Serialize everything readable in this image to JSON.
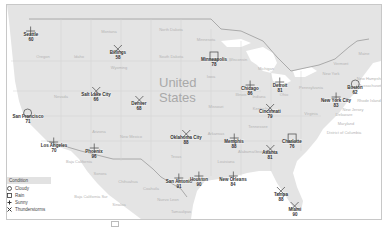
{
  "map": {
    "country_label_line1": "United",
    "country_label_line2": "States",
    "regions": [
      {
        "name": "Montana",
        "x": 108,
        "y": 30
      },
      {
        "name": "North Dakota",
        "x": 170,
        "y": 28
      },
      {
        "name": "Minnesota",
        "x": 205,
        "y": 38
      },
      {
        "name": "South Dakota",
        "x": 170,
        "y": 55
      },
      {
        "name": "Wyoming",
        "x": 118,
        "y": 66
      },
      {
        "name": "Oregon",
        "x": 42,
        "y": 55
      },
      {
        "name": "Idaho",
        "x": 78,
        "y": 55
      },
      {
        "name": "Nevada",
        "x": 60,
        "y": 95
      },
      {
        "name": "Iowa",
        "x": 210,
        "y": 75
      },
      {
        "name": "Missouri",
        "x": 215,
        "y": 105
      },
      {
        "name": "Arizona",
        "x": 98,
        "y": 130
      },
      {
        "name": "New Mexico",
        "x": 130,
        "y": 135
      },
      {
        "name": "Texas",
        "x": 175,
        "y": 155
      },
      {
        "name": "Arkansas",
        "x": 215,
        "y": 132
      },
      {
        "name": "Tennessee",
        "x": 257,
        "y": 125
      },
      {
        "name": "Kentucky",
        "x": 260,
        "y": 107
      },
      {
        "name": "Virginia",
        "x": 310,
        "y": 112
      },
      {
        "name": "Pennsylvania",
        "x": 310,
        "y": 86
      },
      {
        "name": "Michigan",
        "x": 265,
        "y": 67
      },
      {
        "name": "Wisconsin",
        "x": 237,
        "y": 58
      },
      {
        "name": "Ohio",
        "x": 283,
        "y": 93
      },
      {
        "name": "Illinois",
        "x": 240,
        "y": 93
      },
      {
        "name": "Indiana",
        "x": 258,
        "y": 95
      },
      {
        "name": "Georgia",
        "x": 260,
        "y": 150
      },
      {
        "name": "Louisiana",
        "x": 225,
        "y": 160
      },
      {
        "name": "Alabama",
        "x": 245,
        "y": 150
      },
      {
        "name": "Chihuahua",
        "x": 127,
        "y": 180
      },
      {
        "name": "Sonora",
        "x": 99,
        "y": 172
      },
      {
        "name": "Coahuila",
        "x": 150,
        "y": 187
      },
      {
        "name": "Baja California",
        "x": 78,
        "y": 160
      },
      {
        "name": "Baja California Sur",
        "x": 90,
        "y": 195
      },
      {
        "name": "Nuevo Leon",
        "x": 167,
        "y": 198
      },
      {
        "name": "Tamaulipas",
        "x": 180,
        "y": 210
      },
      {
        "name": "Sinaloa",
        "x": 118,
        "y": 203
      },
      {
        "name": "Mexico",
        "x": 158,
        "y": 220
      },
      {
        "name": "New Hampshire",
        "x": 370,
        "y": 77
      },
      {
        "name": "Massachusetts",
        "x": 370,
        "y": 84
      },
      {
        "name": "Rhode Island",
        "x": 368,
        "y": 99
      },
      {
        "name": "New Jersey",
        "x": 352,
        "y": 108
      },
      {
        "name": "Delaware",
        "x": 343,
        "y": 113
      },
      {
        "name": "Maryland",
        "x": 345,
        "y": 122
      },
      {
        "name": "District of Columbia",
        "x": 343,
        "y": 131
      },
      {
        "name": "New York",
        "x": 330,
        "y": 72
      },
      {
        "name": "Maine",
        "x": 363,
        "y": 52
      },
      {
        "name": "Vermont",
        "x": 340,
        "y": 62
      }
    ]
  },
  "cities": [
    {
      "name": "Seattle",
      "temp": "60",
      "condition": "Sunny",
      "x": 31,
      "y": 27
    },
    {
      "name": "Billings",
      "temp": "58",
      "condition": "Thunderstorms",
      "x": 118,
      "y": 45
    },
    {
      "name": "Minneapolis",
      "temp": "78",
      "condition": "Rain",
      "x": 214,
      "y": 52
    },
    {
      "name": "Salt Lake City",
      "temp": "66",
      "condition": "Thunderstorms",
      "x": 96,
      "y": 87
    },
    {
      "name": "Denver",
      "temp": "68",
      "condition": "Thunderstorms",
      "x": 139,
      "y": 96
    },
    {
      "name": "San Francisco",
      "temp": "71",
      "condition": "Cloudy",
      "x": 28,
      "y": 109
    },
    {
      "name": "Los Angeles",
      "temp": "70",
      "condition": "Sunny",
      "x": 54,
      "y": 138
    },
    {
      "name": "Phoenix",
      "temp": "96",
      "condition": "Sunny",
      "x": 94,
      "y": 144
    },
    {
      "name": "Oklahoma City",
      "temp": "88",
      "condition": "Thunderstorms",
      "x": 186,
      "y": 130
    },
    {
      "name": "Memphis",
      "temp": "88",
      "condition": "Sunny",
      "x": 234,
      "y": 134
    },
    {
      "name": "Chicago",
      "temp": "86",
      "condition": "Sunny",
      "x": 250,
      "y": 81
    },
    {
      "name": "Detroit",
      "temp": "81",
      "condition": "Sunny",
      "x": 280,
      "y": 78
    },
    {
      "name": "Cincinnati",
      "temp": "79",
      "condition": "Thunderstorms",
      "x": 270,
      "y": 104
    },
    {
      "name": "Boston",
      "temp": "62",
      "condition": "Cloudy",
      "x": 355,
      "y": 80
    },
    {
      "name": "New York City",
      "temp": "83",
      "condition": "Sunny",
      "x": 336,
      "y": 93
    },
    {
      "name": "Charlotte",
      "temp": "76",
      "condition": "Rain",
      "x": 292,
      "y": 134
    },
    {
      "name": "Atlanta",
      "temp": "81",
      "condition": "Thunderstorms",
      "x": 270,
      "y": 145
    },
    {
      "name": "San Antonio",
      "temp": "91",
      "condition": "Sunny",
      "x": 179,
      "y": 174
    },
    {
      "name": "Houston",
      "temp": "90",
      "condition": "Sunny",
      "x": 199,
      "y": 172
    },
    {
      "name": "New Orleans",
      "temp": "84",
      "condition": "Sunny",
      "x": 233,
      "y": 172
    },
    {
      "name": "Tampa",
      "temp": "88",
      "condition": "Thunderstorms",
      "x": 281,
      "y": 187
    },
    {
      "name": "Miami",
      "temp": "90",
      "condition": "Thunderstorms",
      "x": 295,
      "y": 202
    }
  ],
  "legend": {
    "title": "Condition",
    "items": [
      {
        "label": "Cloudy",
        "icon": "circle-icon"
      },
      {
        "label": "Rain",
        "icon": "square-icon"
      },
      {
        "label": "Sunny",
        "icon": "plus-icon"
      },
      {
        "label": "Thunderstorms",
        "icon": "x-icon"
      }
    ]
  }
}
